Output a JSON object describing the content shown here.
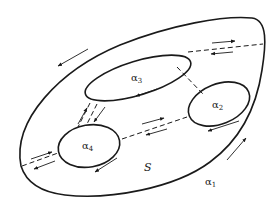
{
  "diagram": {
    "type": "topological surface with boundary components",
    "region_label": "S",
    "curves": [
      {
        "id": "alpha1",
        "symbol": "α",
        "index": "1",
        "role": "outer boundary"
      },
      {
        "id": "alpha2",
        "symbol": "α",
        "index": "2",
        "role": "inner boundary"
      },
      {
        "id": "alpha3",
        "symbol": "α",
        "index": "3",
        "role": "inner boundary"
      },
      {
        "id": "alpha4",
        "symbol": "α",
        "index": "4",
        "role": "inner boundary"
      }
    ],
    "cuts": [
      {
        "from": "alpha3",
        "to": "alpha1",
        "style": "dashed",
        "arrows": "bidirectional"
      },
      {
        "from": "alpha3",
        "to": "alpha2",
        "style": "dashed",
        "arrows": "none"
      },
      {
        "from": "alpha3",
        "to": "alpha4",
        "style": "dashed",
        "arrows": "bidirectional"
      },
      {
        "from": "alpha4",
        "to": "alpha2",
        "style": "dashed",
        "arrows": "bidirectional"
      },
      {
        "from": "alpha4",
        "to": "alpha1",
        "style": "dashed",
        "arrows": "bidirectional"
      }
    ],
    "colors": {
      "stroke": "#1a1a1a",
      "background": "#ffffff"
    }
  }
}
